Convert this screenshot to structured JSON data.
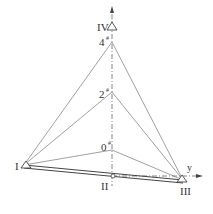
{
  "diagram": {
    "type": "geometric-survey-network",
    "colors": {
      "line": "#555555",
      "thin": "#777777",
      "bg": "#ffffff"
    },
    "stations": [
      {
        "id": "I",
        "label": "I",
        "x": 24,
        "y": 165
      },
      {
        "id": "II",
        "label": "II",
        "x": 113,
        "y": 177
      },
      {
        "id": "III",
        "label": "III",
        "x": 183,
        "y": 180
      },
      {
        "id": "IV",
        "label": "IV",
        "x": 112,
        "y": 27
      }
    ],
    "points": [
      {
        "id": "4",
        "label": "4",
        "sup": "#",
        "x": 112,
        "y": 42
      },
      {
        "id": "2",
        "label": "2",
        "sup": "#",
        "x": 112,
        "y": 92
      },
      {
        "id": "0",
        "label": "0",
        "sup": "#",
        "x": 112,
        "y": 150
      }
    ],
    "axis": {
      "label": "y"
    }
  }
}
